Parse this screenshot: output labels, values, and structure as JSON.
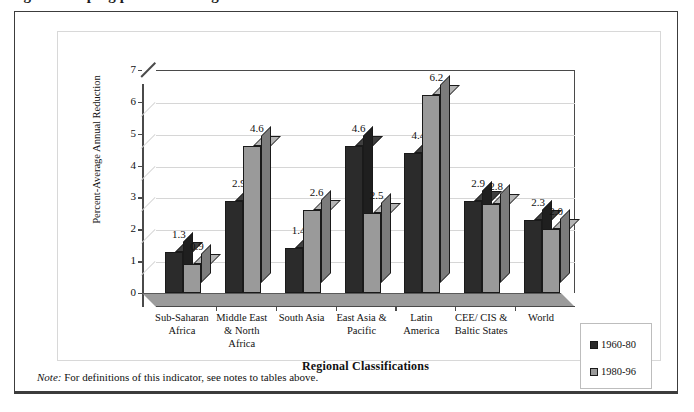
{
  "page": {
    "top_fragment": "figure. Keeping pace with the goal",
    "note_prefix": "Note:",
    "note_text": " For definitions of this indicator, see notes to tables above."
  },
  "chart_data": {
    "type": "bar",
    "title": "",
    "xlabel": "Regional Classifications",
    "ylabel": "Percent-Average Annual Reduction",
    "categories": [
      "Sub-Saharan\nAfrica",
      "Middle East\n& North\nAfrica",
      "South Asia",
      "East Asia &\nPacific",
      "Latin\nAmerica",
      "CEE/ CIS &\nBaltic States",
      "World"
    ],
    "series": [
      {
        "name": "1960-80",
        "color": "#2b2b2b",
        "values": [
          1.3,
          2.9,
          1.4,
          4.6,
          4.4,
          2.9,
          2.3
        ]
      },
      {
        "name": "1980-96",
        "color": "#9a9a9a",
        "values": [
          0.9,
          4.6,
          2.6,
          2.5,
          6.2,
          2.8,
          2.0
        ]
      }
    ],
    "ylim": [
      0,
      7
    ],
    "yticks": [
      0,
      1,
      2,
      3,
      4,
      5,
      6,
      7
    ],
    "ytick_labels": [
      "0",
      "1",
      "2",
      "3",
      "4",
      "5",
      "6",
      "7"
    ],
    "grid": true,
    "legend_position": "bottom-right",
    "three_d": true
  }
}
